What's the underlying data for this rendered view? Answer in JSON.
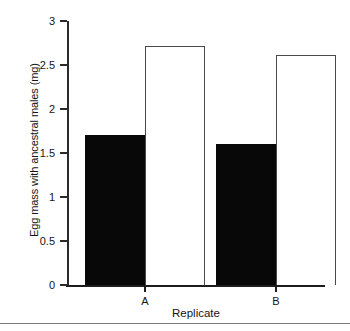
{
  "chart_data": {
    "type": "bar",
    "title": "",
    "xlabel": "Replicate",
    "ylabel": "Egg mass with ancestral males (mg)",
    "categories": [
      "A",
      "B"
    ],
    "series": [
      {
        "name": "filled-black-bar",
        "values": [
          1.7,
          1.6
        ],
        "color": "#080808",
        "style": "filled"
      },
      {
        "name": "open-white-bar",
        "values": [
          2.72,
          2.61
        ],
        "color": "#ffffff",
        "style": "open"
      }
    ],
    "ylim": [
      0,
      3
    ],
    "ytick_labels": [
      "0",
      "0.5",
      "1",
      "1.5",
      "2",
      "2.5",
      "3"
    ],
    "ytick_values": [
      0,
      0.5,
      1,
      1.5,
      2,
      2.5,
      3
    ],
    "grid": false,
    "legend": "none",
    "legend_position": "none"
  },
  "axes": {
    "y_title": "Egg mass with ancestral males (mg)",
    "x_title": "Replicate"
  }
}
